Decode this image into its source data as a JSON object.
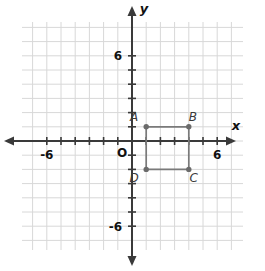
{
  "figure": {
    "kind": "coordinate-plane-with-rectangle",
    "background_color": "#ffffff"
  },
  "chart_data": {
    "type": "scatter",
    "title": "",
    "xlabel": "x",
    "ylabel": "y",
    "xlim": [
      -8,
      8
    ],
    "ylim": [
      -8,
      8
    ],
    "grid": true,
    "grid_step": 1,
    "legend": "none",
    "x_tick_labels": [
      "-6",
      "6"
    ],
    "x_tick_values": [
      -6,
      6
    ],
    "y_tick_labels": [
      "6",
      "-6"
    ],
    "y_tick_values": [
      6,
      -6
    ],
    "origin_label": "O",
    "tick_values_major": [
      -6,
      -5,
      -4,
      -3,
      -2,
      -1,
      1,
      2,
      3,
      4,
      5,
      6
    ],
    "series": [
      {
        "name": "Rectangle ABCD",
        "closed": true,
        "stroke_color": "#7a7a7a",
        "point_color": "#6b6b6b",
        "points": [
          {
            "label": "A",
            "x": 1,
            "y": 1,
            "label_dx": -12,
            "label_dy": -6
          },
          {
            "label": "B",
            "x": 4,
            "y": 1,
            "label_dx": 4,
            "label_dy": -6
          },
          {
            "label": "C",
            "x": 4,
            "y": -2,
            "label_dx": 5,
            "label_dy": 13
          },
          {
            "label": "D",
            "x": 1,
            "y": -2,
            "label_dx": -12,
            "label_dy": 13
          }
        ]
      }
    ]
  },
  "colors": {
    "grid_line": "#d8d8d8",
    "axis_line": "#3a3a3a",
    "shape_stroke": "#7a7a7a",
    "shape_point": "#6b6b6b",
    "text": "#111111"
  },
  "axes": {
    "x_axis_name": "x",
    "y_axis_name": "y"
  }
}
